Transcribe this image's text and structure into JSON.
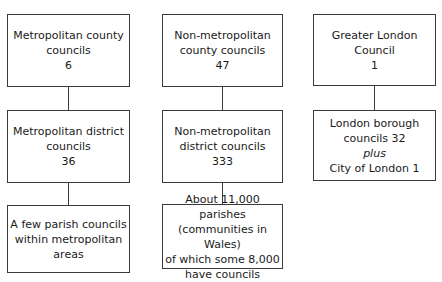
{
  "diagram": {
    "columns": [
      {
        "boxes": [
          {
            "lines": [
              "Metropolitan county",
              "councils",
              "6"
            ]
          },
          {
            "lines": [
              "Metropolitan district",
              "councils",
              "36"
            ]
          },
          {
            "lines": [
              "A few parish councils",
              "within metropolitan",
              "areas"
            ]
          }
        ]
      },
      {
        "boxes": [
          {
            "lines": [
              "Non-metropolitan",
              "county councils",
              "47"
            ]
          },
          {
            "lines": [
              "Non-metropolitan",
              "district councils",
              "333"
            ]
          },
          {
            "lines": [
              "About 11,000 parishes",
              "(communities in Wales)",
              "of which some 8,000",
              "have councils"
            ]
          }
        ]
      },
      {
        "boxes": [
          {
            "lines": [
              "Greater London",
              "Council",
              "1"
            ]
          },
          {
            "lines": [
              "London borough",
              "councils 32",
              "plus",
              "City of London 1"
            ]
          }
        ]
      }
    ]
  }
}
